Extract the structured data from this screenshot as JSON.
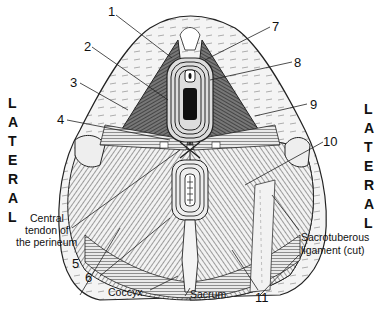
{
  "diagram": {
    "side_labels": {
      "left": [
        "L",
        "A",
        "T",
        "E",
        "R",
        "A",
        "L"
      ],
      "right": [
        "L",
        "A",
        "T",
        "E",
        "R",
        "A",
        "L"
      ]
    },
    "numbered_callouts": [
      "1",
      "2",
      "3",
      "4",
      "5",
      "6",
      "7",
      "8",
      "9",
      "10",
      "11"
    ],
    "text_labels": {
      "central_tendon_line1": "Central",
      "central_tendon_line2": "tendon of",
      "central_tendon_line3": "the perineum",
      "coccyx": "Coccyx",
      "sacrum": "Sacrum",
      "sacrotuberous_line1": "Sacrotuberous",
      "sacrotuberous_line2": "ligament (cut)"
    },
    "colors": {
      "ink": "#111111",
      "bone": "#e8e8e8",
      "muscle_dark": "#3a3a3a",
      "background": "#ffffff"
    }
  }
}
